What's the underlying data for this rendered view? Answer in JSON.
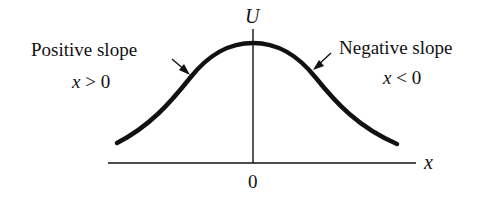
{
  "diagram": {
    "type": "potential-energy-curve",
    "curve_shape": "bell (maximum at origin)",
    "axes": {
      "y_label": "U",
      "x_label": "x",
      "origin_label": "0"
    },
    "annotations": [
      {
        "id": "left",
        "title": "Positive slope",
        "condition_var": "x",
        "condition_op": ">",
        "condition_val": "0"
      },
      {
        "id": "right",
        "title": "Negative slope",
        "condition_var": "x",
        "condition_op": "<",
        "condition_val": "0"
      }
    ],
    "colors": {
      "ink": "#111111",
      "background": "#ffffff"
    }
  }
}
